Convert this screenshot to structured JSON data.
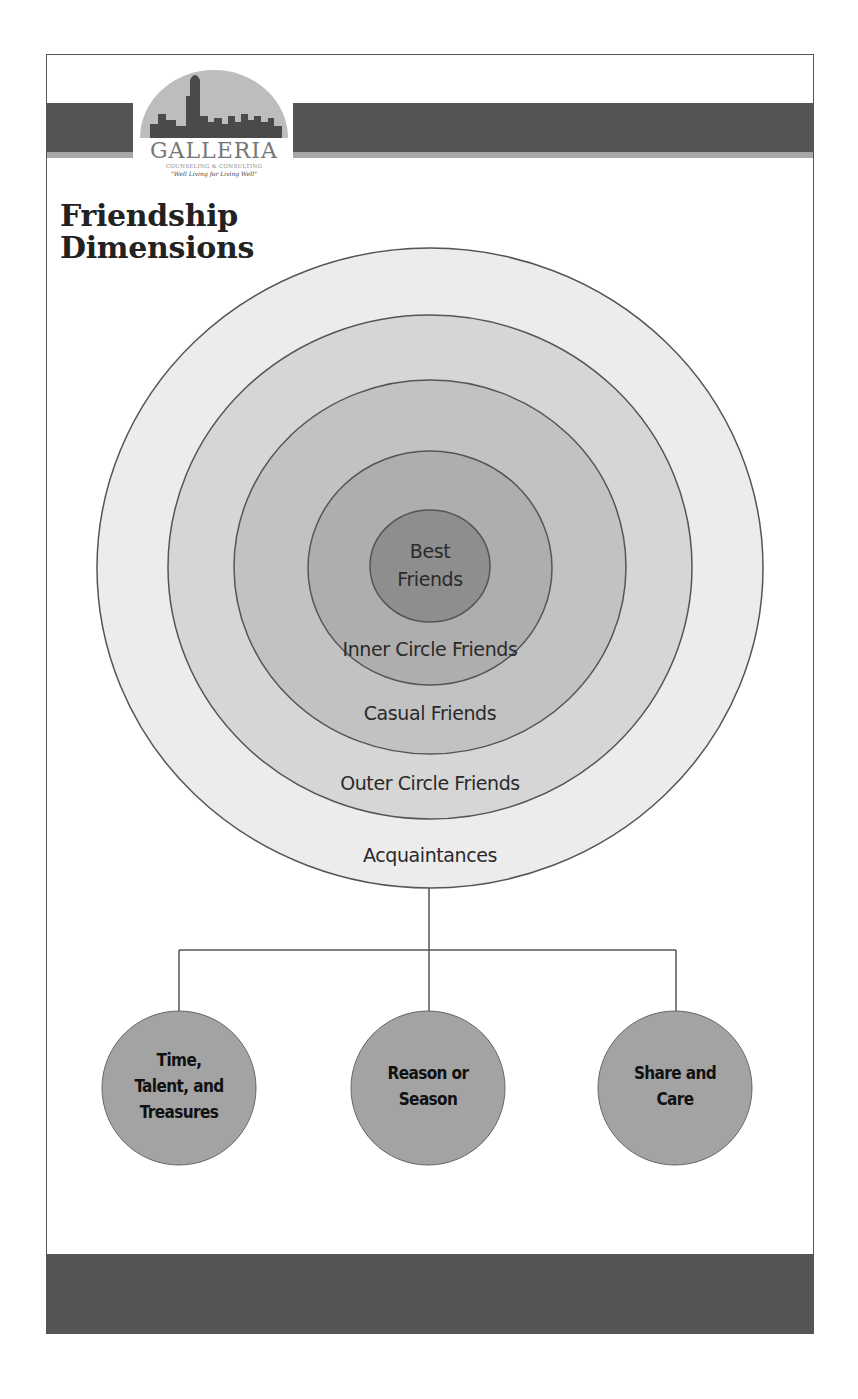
{
  "header": {
    "logo": {
      "icon": "city-skyline-icon",
      "name": "GALLERIA",
      "subtitle": "COUNSELING & CONSULTING",
      "tagline": "\"Well Living for Living Well\""
    },
    "title_line1": "Friendship",
    "title_line2": "Dimensions"
  },
  "rings": [
    {
      "label": "Acquaintances",
      "fill": "#ececec"
    },
    {
      "label": "Outer Circle Friends",
      "fill": "#d6d6d6"
    },
    {
      "label": "Casual Friends",
      "fill": "#c2c2c2"
    },
    {
      "label": "Inner Circle Friends",
      "fill": "#aeaeae"
    },
    {
      "label_line1": "Best",
      "label_line2": "Friends",
      "fill": "#8e8e8e"
    }
  ],
  "nodes": [
    {
      "line1": "Time,",
      "line2": "Talent, and",
      "line3": "Treasures"
    },
    {
      "line1": "Reason or",
      "line2": "Season"
    },
    {
      "line1": "Share and",
      "line2": "Care"
    }
  ],
  "colors": {
    "bar": "#555555",
    "stripe": "#a8a8a8",
    "node_fill": "#a3a3a3",
    "stroke": "#555555"
  }
}
